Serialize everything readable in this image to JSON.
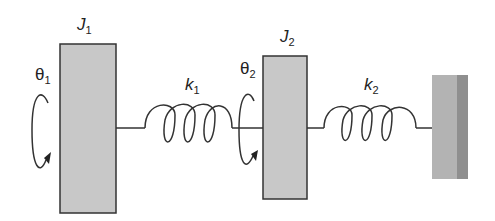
{
  "diagram": {
    "type": "two-inertia torsional spring system",
    "inertias": [
      {
        "label": "J",
        "subscript": "1",
        "angle_label": "θ",
        "angle_subscript": "1"
      },
      {
        "label": "J",
        "subscript": "2",
        "angle_label": "θ",
        "angle_subscript": "2"
      }
    ],
    "springs": [
      {
        "label": "k",
        "subscript": "1"
      },
      {
        "label": "k",
        "subscript": "2"
      }
    ],
    "wall": {
      "name": "fixed-wall"
    },
    "colors": {
      "block_fill": "#c8c8c8",
      "stroke": "#333333",
      "wall_fill": "#b3b3b3",
      "wall_dark": "#8f8f8f"
    }
  }
}
